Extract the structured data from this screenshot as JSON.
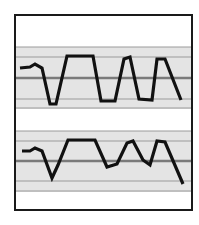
{
  "figure": {
    "frame": {
      "x": 15,
      "y": 15,
      "width": 177,
      "height": 195,
      "stroke": "#1a1a1a",
      "stroke_width": 2
    },
    "band_fill": "#e4e4e4",
    "grid_color": "#9a9a9a",
    "mid_line_color": "#7a7a7a",
    "trace_color": "#111111",
    "panels": [
      {
        "name": "upper",
        "band": {
          "y_top": 47,
          "y_bottom": 109
        },
        "grid_lines": [
          47,
          57,
          78,
          99,
          108
        ],
        "mid_line": 78,
        "trace": [
          [
            20,
            68
          ],
          [
            30,
            67
          ],
          [
            35,
            64
          ],
          [
            42,
            68
          ],
          [
            50,
            104
          ],
          [
            56,
            104
          ],
          [
            67,
            56
          ],
          [
            93,
            56
          ],
          [
            101,
            101
          ],
          [
            115,
            101
          ],
          [
            124,
            59
          ],
          [
            130,
            57
          ],
          [
            139,
            99
          ],
          [
            152,
            100
          ],
          [
            157,
            59
          ],
          [
            165,
            59
          ],
          [
            181,
            100
          ]
        ]
      },
      {
        "name": "lower",
        "band": {
          "y_top": 131,
          "y_bottom": 192
        },
        "grid_lines": [
          131,
          141,
          161,
          181,
          191
        ],
        "mid_line": 161,
        "trace": [
          [
            22,
            151
          ],
          [
            30,
            151
          ],
          [
            35,
            148
          ],
          [
            42,
            151
          ],
          [
            52,
            178
          ],
          [
            58,
            165
          ],
          [
            68,
            140
          ],
          [
            95,
            140
          ],
          [
            107,
            167
          ],
          [
            117,
            164
          ],
          [
            127,
            143
          ],
          [
            133,
            141
          ],
          [
            143,
            160
          ],
          [
            150,
            165
          ],
          [
            157,
            141
          ],
          [
            165,
            142
          ],
          [
            183,
            184
          ]
        ]
      }
    ]
  }
}
